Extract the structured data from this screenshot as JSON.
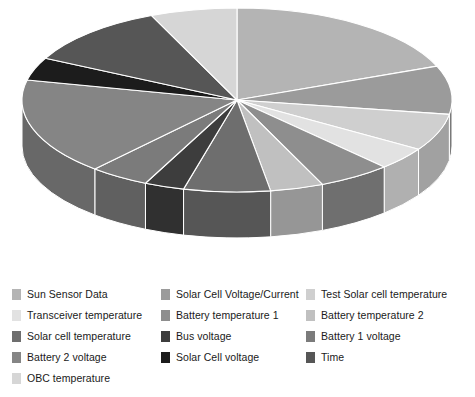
{
  "chart_data": {
    "type": "pie",
    "title": "",
    "three_d": true,
    "legend_position": "bottom",
    "center": {
      "x": 237,
      "y": 100
    },
    "radius_x": 215,
    "radius_y": 92,
    "depth": 46,
    "start_angle_deg": -90,
    "separator_color": "#ffffff",
    "categories": [
      "Sun Sensor Data",
      "Solar Cell Voltage/Current",
      "Test Solar cell temperature",
      "Transceiver temperature",
      "Battery temperature 1",
      "Battery temperature 2",
      "Solar cell temperature",
      "Bus voltage",
      "Battery 1 voltage",
      "Battery 2 voltage",
      "Solar Cell voltage",
      "Time",
      "OBC temperature"
    ],
    "values": [
      19.0,
      8.5,
      6.5,
      4.0,
      5.5,
      4.0,
      6.5,
      3.0,
      4.5,
      17.0,
      4.0,
      11.0,
      6.5
    ],
    "colors": [
      "#b4b4b4",
      "#9b9b9b",
      "#cfcfcf",
      "#e2e2e2",
      "#8e8e8e",
      "#c0c0c0",
      "#6e6e6e",
      "#3d3d3d",
      "#7b7b7b",
      "#858585",
      "#1c1c1c",
      "#565656",
      "#d6d6d6"
    ],
    "xlabel": "",
    "ylabel": ""
  },
  "legend": {
    "columns": [
      {
        "items": [
          {
            "label": "Sun Sensor Data",
            "color": "#b4b4b4"
          },
          {
            "label": "Transceiver temperature",
            "color": "#e2e2e2"
          },
          {
            "label": "Solar cell temperature",
            "color": "#6e6e6e"
          },
          {
            "label": "Battery 2 voltage",
            "color": "#858585"
          },
          {
            "label": "OBC temperature",
            "color": "#d6d6d6"
          }
        ]
      },
      {
        "items": [
          {
            "label": "Solar Cell Voltage/Current",
            "color": "#9b9b9b"
          },
          {
            "label": "Battery temperature 1",
            "color": "#8e8e8e"
          },
          {
            "label": "Bus voltage",
            "color": "#3d3d3d"
          },
          {
            "label": "Solar Cell voltage",
            "color": "#1c1c1c"
          }
        ]
      },
      {
        "items": [
          {
            "label": "Test Solar cell temperature",
            "color": "#cfcfcf"
          },
          {
            "label": "Battery temperature 2",
            "color": "#c0c0c0"
          },
          {
            "label": "Battery 1 voltage",
            "color": "#7b7b7b"
          },
          {
            "label": "Time",
            "color": "#565656"
          }
        ]
      }
    ]
  }
}
